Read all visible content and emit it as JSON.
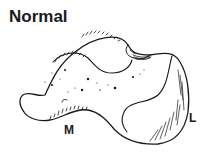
{
  "figure": {
    "title": "Normal",
    "labels": {
      "medial": "M",
      "lateral": "L"
    },
    "illustration": "bone-outline-drawing",
    "stroke_color": "#1a1a1a",
    "background_color": "#ffffff"
  }
}
